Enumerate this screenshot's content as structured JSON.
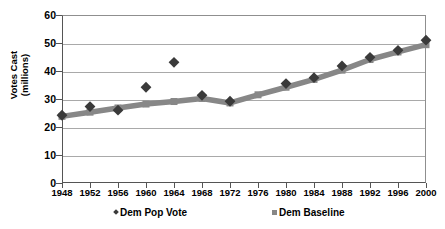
{
  "chart_data": {
    "type": "line",
    "title": "",
    "xlabel": "",
    "ylabel": "Votes Cast (millions)",
    "ylabel_line1": "Votes Cast",
    "ylabel_line2": "(millions)",
    "categories": [
      "1948",
      "1952",
      "1956",
      "1960",
      "1964",
      "1968",
      "1972",
      "1976",
      "1980",
      "1984",
      "1988",
      "1992",
      "1996",
      "2000"
    ],
    "x": [
      1948,
      1952,
      1956,
      1960,
      1964,
      1968,
      1972,
      1976,
      1980,
      1984,
      1988,
      1992,
      1996,
      2000
    ],
    "series": [
      {
        "name": "Dem Pop Vote",
        "marker": "diamond",
        "color": "#3a3a3a",
        "line": false,
        "values": [
          24.2,
          27.3,
          26.0,
          34.2,
          43.1,
          31.3,
          29.2,
          null,
          35.5,
          37.6,
          41.8,
          44.9,
          47.4,
          51.0
        ]
      },
      {
        "name": "Dem Baseline",
        "marker": "square",
        "color": "#878787",
        "line": true,
        "values": [
          23.8,
          25.3,
          26.8,
          28.2,
          29.1,
          30.2,
          28.6,
          31.5,
          34.2,
          37.0,
          40.3,
          44.1,
          46.8,
          49.4
        ]
      }
    ],
    "ylim": [
      0,
      60
    ],
    "yticks": [
      0,
      10,
      20,
      30,
      40,
      50,
      60
    ],
    "xlim": [
      1948,
      2000
    ],
    "grid": true,
    "legend_position": "bottom"
  },
  "axes": {
    "y_title_line1": "Votes Cast",
    "y_title_line2": "(millions)",
    "y_tick_labels": [
      "60",
      "50",
      "40",
      "30",
      "20",
      "10",
      "0"
    ],
    "x_tick_labels": [
      "1948",
      "1952",
      "1956",
      "1960",
      "1964",
      "1968",
      "1972",
      "1976",
      "1980",
      "1984",
      "1988",
      "1992",
      "1996",
      "2000"
    ]
  },
  "legend": {
    "items": [
      {
        "label": "Dem Pop Vote",
        "marker": "diamond",
        "color": "#3a3a3a"
      },
      {
        "label": "Dem Baseline",
        "marker": "square",
        "color": "#878787"
      }
    ]
  },
  "colors": {
    "pop_vote": "#3a3a3a",
    "baseline": "#878787",
    "grid": "#a9a9a9",
    "axis": "#555555",
    "background": "#ffffff"
  }
}
